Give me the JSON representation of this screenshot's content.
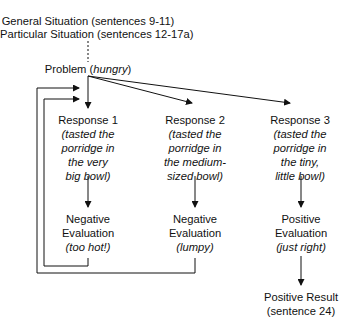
{
  "header": {
    "general_situation": "General Situation (sentences 9-11)",
    "particular_situation": "Particular Situation (sentences 12-17a)"
  },
  "problem": {
    "label": "Problem (",
    "detail": "hungry",
    "close": ")"
  },
  "responses": [
    {
      "title": "Response 1",
      "lines": [
        "(tasted the",
        "porridge in",
        "the very",
        "big bowl)"
      ]
    },
    {
      "title": "Response 2",
      "lines": [
        "(tasted the",
        "porridge in",
        "the medium-",
        "sized bowl)"
      ]
    },
    {
      "title": "Response 3",
      "lines": [
        "(tasted the",
        "porridge in",
        "the tiny,",
        "little bowl)"
      ]
    }
  ],
  "evaluations": [
    {
      "line1": "Negative",
      "line2": "Evaluation",
      "detail": "(too hot!)"
    },
    {
      "line1": "Negative",
      "line2": "Evaluation",
      "detail": "(lumpy)"
    },
    {
      "line1": "Positive",
      "line2": "Evaluation",
      "detail": "(just right)"
    }
  ],
  "result": {
    "line1": "Positive Result",
    "line2": "(sentence 24)"
  },
  "colors": {
    "line": "#111111",
    "text": "#111111",
    "background": "#ffffff"
  }
}
